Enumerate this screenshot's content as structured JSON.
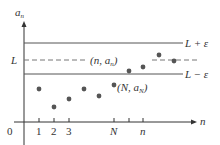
{
  "diagram": {
    "title": "",
    "y_axis_label": "a",
    "y_axis_sub": "n",
    "x_axis_label": "n",
    "origin_label": "0",
    "lines": {
      "upper": {
        "label": "L + ε",
        "y": 43
      },
      "middle": {
        "label": "L",
        "y": 60,
        "style": "dashed"
      },
      "lower": {
        "label": "L − ε",
        "y": 74
      }
    },
    "x_ticks": [
      {
        "label": "1",
        "x": 39
      },
      {
        "label": "2",
        "x": 54
      },
      {
        "label": "3",
        "x": 69
      },
      {
        "label": "N",
        "x": 114
      },
      {
        "label": "",
        "x": 129
      },
      {
        "label": "n",
        "x": 143
      }
    ],
    "annotations": {
      "point_n": "(n, a",
      "point_n_sub": "n",
      "point_n_close": ")",
      "point_N": "(N, a",
      "point_N_sub": "N",
      "point_N_close": ")"
    },
    "points": [
      {
        "x": 39,
        "y": 89
      },
      {
        "x": 54,
        "y": 107
      },
      {
        "x": 69,
        "y": 99
      },
      {
        "x": 84,
        "y": 89
      },
      {
        "x": 99,
        "y": 96
      },
      {
        "x": 114,
        "y": 85
      },
      {
        "x": 129,
        "y": 71
      },
      {
        "x": 143,
        "y": 67
      },
      {
        "x": 159,
        "y": 55
      },
      {
        "x": 174,
        "y": 61
      }
    ],
    "colors": {
      "axis": "#333333",
      "line": "#555555",
      "point": "#555555"
    }
  }
}
